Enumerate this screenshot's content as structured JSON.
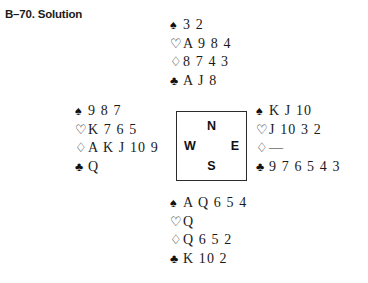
{
  "title": "B–70. Solution",
  "suit_symbols": {
    "spades": "♠",
    "hearts": "♡",
    "diamonds": "♢",
    "clubs": "♣"
  },
  "compass": {
    "north": "N",
    "west": "W",
    "east": "E",
    "south": "S"
  },
  "hands": {
    "north": {
      "spades": "3 2",
      "hearts": "A 9 8 4",
      "diamonds": "8 7 4 3",
      "clubs": "A J 8"
    },
    "west": {
      "spades": "9 8 7",
      "hearts": "K 7 6 5",
      "diamonds": "A K J 10 9",
      "clubs": "Q"
    },
    "east": {
      "spades": "K J 10",
      "hearts": "J 10 3 2",
      "diamonds": "—",
      "clubs": "9 7 6 5 4 3"
    },
    "south": {
      "spades": "A Q 6 5 4",
      "hearts": "Q",
      "diamonds": "Q 6 5 2",
      "clubs": "K 10 2"
    }
  }
}
